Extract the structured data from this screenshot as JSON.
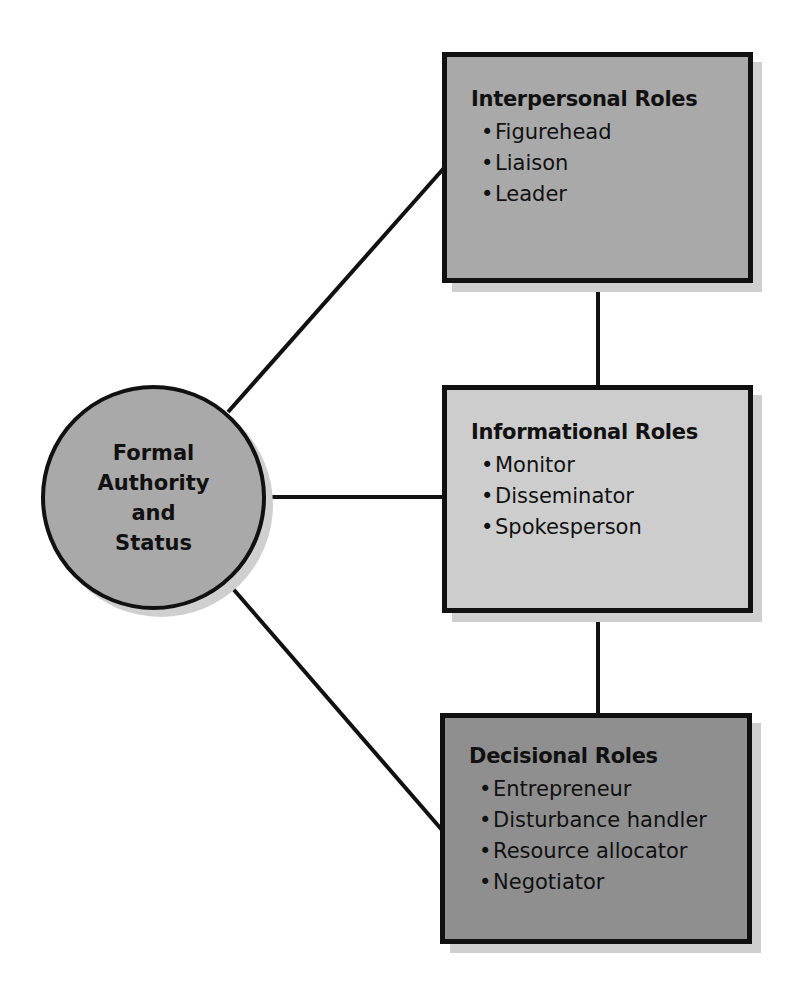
{
  "colors": {
    "interpersonal_fill": "#a9a9a9",
    "informational_fill": "#cdcdcd",
    "decisional_fill": "#8f8f8f",
    "circle_fill": "#a9a9a9",
    "stroke": "#111111",
    "shadow": "#cfcfcf"
  },
  "center": {
    "label": "Formal\nAuthority\nand\nStatus"
  },
  "boxes": [
    {
      "title": "Interpersonal Roles",
      "items": [
        "Figurehead",
        "Liaison",
        "Leader"
      ]
    },
    {
      "title": "Informational Roles",
      "items": [
        "Monitor",
        "Disseminator",
        "Spokesperson"
      ]
    },
    {
      "title": "Decisional Roles",
      "items": [
        "Entrepreneur",
        "Disturbance handler",
        "Resource allocator",
        "Negotiator"
      ]
    }
  ],
  "bullet": "•"
}
